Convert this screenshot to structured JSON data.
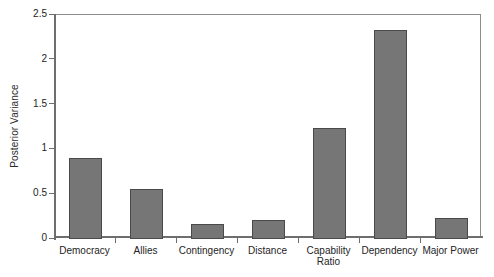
{
  "chart_data": {
    "type": "bar",
    "title": "",
    "xlabel": "",
    "ylabel": "Posterior Variance",
    "categories": [
      "Democracy",
      "Allies",
      "Contingency",
      "Distance",
      "Capability\nRatio",
      "Dependency",
      "Major Power"
    ],
    "values": [
      0.9,
      0.56,
      0.17,
      0.21,
      1.24,
      2.33,
      0.23
    ],
    "ylim": [
      0,
      2.5
    ],
    "ytick_labels": [
      "0",
      "0.5",
      "1",
      "1.5",
      "2",
      "2.5"
    ],
    "ytick_values": [
      0,
      0.5,
      1,
      1.5,
      2,
      2.5
    ],
    "grid": false,
    "legend": false,
    "bar_color": "#767676",
    "bar_edge_color": "#4a4a4a",
    "axis_color": "#6e6e6e",
    "background": "#ffffff"
  }
}
